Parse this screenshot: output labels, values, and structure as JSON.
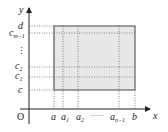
{
  "diagram": {
    "title": "",
    "type": "partitioned-rectangle",
    "axes": {
      "x_label": "x",
      "y_label": "y",
      "origin_label": "O"
    },
    "x_ticks": [
      {
        "label": "a",
        "sub": ""
      },
      {
        "label": "a",
        "sub": "1"
      },
      {
        "label": "a",
        "sub": "2"
      },
      {
        "label": "a",
        "sub": "n−1"
      },
      {
        "label": "b",
        "sub": ""
      }
    ],
    "x_ellipsis": "······",
    "y_ticks": [
      {
        "label": "c",
        "sub": ""
      },
      {
        "label": "c",
        "sub": "1"
      },
      {
        "label": "c",
        "sub": "2"
      },
      {
        "label": "c",
        "sub": "m−1"
      },
      {
        "label": "d",
        "sub": ""
      }
    ],
    "y_ellipsis": "⋮",
    "colors": {
      "region_fill": "#e8e8e8",
      "region_stroke": "#444444",
      "axis": "#222222",
      "grid_dotted": "#666666"
    }
  }
}
